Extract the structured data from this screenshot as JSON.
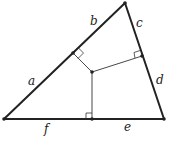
{
  "diagram": {
    "type": "triangle-perpendiculars",
    "vertices": {
      "A": [
        4,
        119
      ],
      "B": [
        125,
        3
      ],
      "C": [
        164,
        119
      ]
    },
    "interior_point": [
      92,
      72
    ],
    "feet": {
      "AB": [
        73,
        53
      ],
      "BC": [
        142,
        56
      ],
      "CA": [
        92,
        119
      ]
    },
    "segment_labels": {
      "a": "a",
      "b": "b",
      "c": "c",
      "d": "d",
      "e": "e",
      "f": "f"
    },
    "colors": {
      "edge": "#222222",
      "perpendicular": "#333333",
      "background": "#ffffff"
    }
  }
}
